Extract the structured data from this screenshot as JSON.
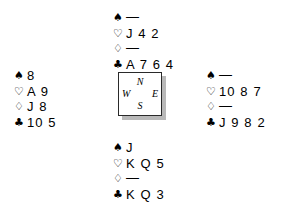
{
  "diagram": {
    "type": "bridge-hand-diagram",
    "suit_symbols": {
      "spades": "♠",
      "hearts": "♡",
      "diamonds": "♢",
      "clubs": "♣"
    },
    "void_mark": "—",
    "compass": {
      "north": "N",
      "south": "S",
      "west": "W",
      "east": "E"
    },
    "hands": {
      "north": {
        "position_label": "North",
        "suits": [
          {
            "suit": "spades",
            "symbol": "♠",
            "fill": "black",
            "cards": "—",
            "void": true
          },
          {
            "suit": "hearts",
            "symbol": "♡",
            "fill": "hollow",
            "cards": "J 4 2",
            "void": false
          },
          {
            "suit": "diamonds",
            "symbol": "♢",
            "fill": "hollow",
            "cards": "—",
            "void": true
          },
          {
            "suit": "clubs",
            "symbol": "♣",
            "fill": "black",
            "cards": "A 7 6 4",
            "void": false
          }
        ]
      },
      "west": {
        "position_label": "West",
        "suits": [
          {
            "suit": "spades",
            "symbol": "♠",
            "fill": "black",
            "cards": "8",
            "void": false
          },
          {
            "suit": "hearts",
            "symbol": "♡",
            "fill": "hollow",
            "cards": "A 9",
            "void": false
          },
          {
            "suit": "diamonds",
            "symbol": "♢",
            "fill": "hollow",
            "cards": "J 8",
            "void": false
          },
          {
            "suit": "clubs",
            "symbol": "♣",
            "fill": "black",
            "cards": "10 5",
            "void": false
          }
        ]
      },
      "east": {
        "position_label": "East",
        "suits": [
          {
            "suit": "spades",
            "symbol": "♠",
            "fill": "black",
            "cards": "—",
            "void": true
          },
          {
            "suit": "hearts",
            "symbol": "♡",
            "fill": "hollow",
            "cards": "10 8 7",
            "void": false
          },
          {
            "suit": "diamonds",
            "symbol": "♢",
            "fill": "hollow",
            "cards": "—",
            "void": true
          },
          {
            "suit": "clubs",
            "symbol": "♣",
            "fill": "black",
            "cards": "J 9 8 2",
            "void": false
          }
        ]
      },
      "south": {
        "position_label": "South",
        "suits": [
          {
            "suit": "spades",
            "symbol": "♠",
            "fill": "black",
            "cards": "J",
            "void": false
          },
          {
            "suit": "hearts",
            "symbol": "♡",
            "fill": "hollow",
            "cards": "K Q 5",
            "void": false
          },
          {
            "suit": "diamonds",
            "symbol": "♢",
            "fill": "hollow",
            "cards": "—",
            "void": true
          },
          {
            "suit": "clubs",
            "symbol": "♣",
            "fill": "black",
            "cards": "K Q 3",
            "void": false
          }
        ]
      }
    }
  }
}
